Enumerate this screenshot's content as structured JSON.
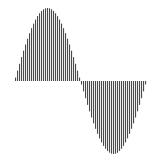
{
  "chart_data": {
    "type": "bar",
    "title": "",
    "xlabel": "",
    "ylabel": "",
    "function": "sin",
    "x_range": [
      0,
      6.2832
    ],
    "ylim": [
      -1,
      1
    ],
    "grid": false,
    "legend": null,
    "sample_count": 66,
    "bar_color": "#4a4a4a",
    "gap_color": "#ffffff",
    "baseline": 0
  },
  "layout": {
    "plot_left_px": 15,
    "plot_right_px": 147,
    "baseline_y_px": 81,
    "amplitude_px": 73
  }
}
